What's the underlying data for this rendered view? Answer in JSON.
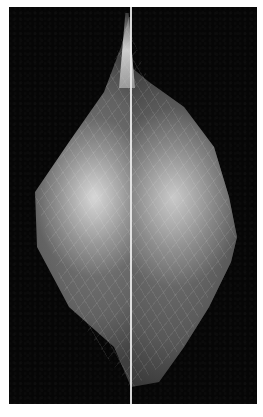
{
  "figure": {
    "type": "grayscale medical image (mammogram-style, split view)",
    "background_color": "#060606",
    "divider_color": "#ebebeb",
    "caption": ""
  }
}
